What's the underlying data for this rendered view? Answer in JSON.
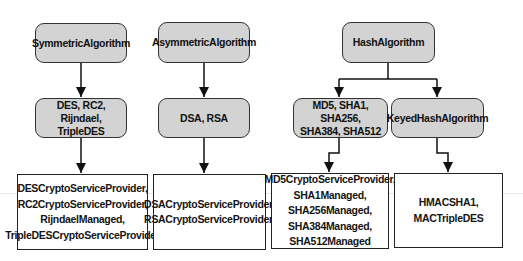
{
  "diagram": {
    "title": "",
    "colors": {
      "rounded_fill": "#d3d3d3",
      "border": "#333333",
      "arrow": "#111111"
    },
    "columns": [
      {
        "root": {
          "label": "SymmetricAlgorithm"
        },
        "middle": [
          {
            "label": "DES, RC2, Rijndael,\nTripleDES"
          }
        ],
        "leaves": [
          {
            "label": "DESCryptoServiceProvider,\nRC2CryptoServiceProvider,\nRijndaelManaged,\nTripleDESCryptoServiceProvider"
          }
        ]
      },
      {
        "root": {
          "label": "AsymmetricAlgorithm"
        },
        "middle": [
          {
            "label": "DSA, RSA"
          }
        ],
        "leaves": [
          {
            "label": "DSACryptoServiceProvider,\nRSACryptoServiceProvider,"
          }
        ]
      },
      {
        "root": {
          "label": "HashAlgorithm"
        },
        "middle": [
          {
            "label": "MD5, SHA1, SHA256,\nSHA384, SHA512"
          },
          {
            "label": "KeyedHashAlgorithm"
          }
        ],
        "leaves": [
          {
            "label": "MD5CryptoServiceProvider,\nSHA1Managed,\nSHA256Managed,\nSHA384Managed,\nSHA512Managed"
          },
          {
            "label": "HMACSHA1,\nMACTripleDES"
          }
        ]
      }
    ],
    "edges": [
      {
        "from": "SymmetricAlgorithm",
        "to": "DES, RC2, Rijndael, TripleDES"
      },
      {
        "from": "DES, RC2, Rijndael, TripleDES",
        "to": "DESCryptoServiceProvider, ..."
      },
      {
        "from": "AsymmetricAlgorithm",
        "to": "DSA, RSA"
      },
      {
        "from": "DSA, RSA",
        "to": "DSACryptoServiceProvider, ..."
      },
      {
        "from": "HashAlgorithm",
        "to": "MD5, SHA1, SHA256, SHA384, SHA512"
      },
      {
        "from": "HashAlgorithm",
        "to": "KeyedHashAlgorithm"
      },
      {
        "from": "MD5, SHA1, SHA256, SHA384, SHA512",
        "to": "MD5CryptoServiceProvider, ..."
      },
      {
        "from": "KeyedHashAlgorithm",
        "to": "HMACSHA1, MACTripleDES"
      }
    ]
  }
}
